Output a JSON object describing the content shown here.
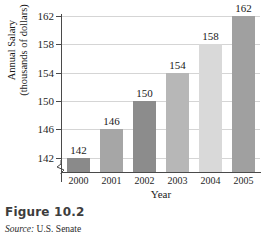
{
  "figure": {
    "number_label": "Figure 10.2",
    "source_prefix": "Source:",
    "source_text": "U.S. Senate"
  },
  "chart_data": {
    "type": "bar",
    "title": "",
    "categories": [
      "2000",
      "2001",
      "2002",
      "2003",
      "2004",
      "2005"
    ],
    "values": [
      142,
      146,
      150,
      154,
      158,
      162
    ],
    "xlabel": "Year",
    "ylabel": "Annual Salary",
    "ylabel_line1": "Annual Salary",
    "ylabel_line2": "(thousands of dollars)",
    "yunits": "thousands of dollars",
    "ylim": [
      140,
      162
    ],
    "yticks": [
      142,
      146,
      150,
      154,
      158,
      162
    ],
    "ytick_labels": [
      "142",
      "146",
      "150",
      "154",
      "158",
      "162"
    ],
    "axis_break": true,
    "grid": true,
    "legend": "none",
    "data_labels": [
      "142",
      "146",
      "150",
      "154",
      "158",
      "162"
    ],
    "bar_colors": [
      "#8a8a8a",
      "#a6a6a6",
      "#8c8c8c",
      "#b7b7b7",
      "#d9d9d9",
      "#a0a0a0"
    ],
    "series": [
      {
        "name": "Annual Salary",
        "values": [
          142,
          146,
          150,
          154,
          158,
          162
        ]
      }
    ]
  },
  "colors": {
    "axis": "#4a4a4a",
    "gridline": "#d5d5d5",
    "text": "#1a1a1a",
    "background": "#ffffff"
  }
}
